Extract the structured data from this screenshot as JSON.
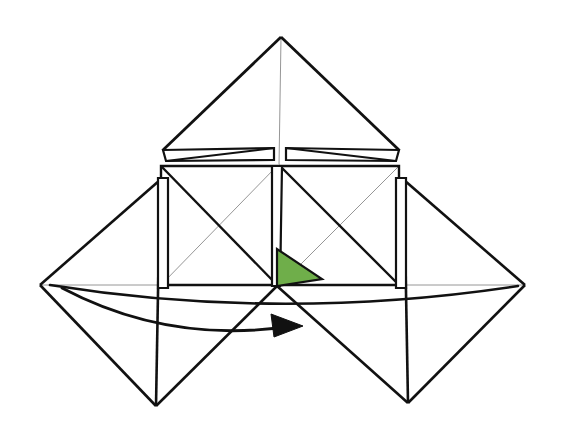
{
  "figure": {
    "background_color": "#ffffff",
    "stroke_color": "#111111",
    "thin_stroke_color": "#8a8a8a",
    "highlight_fill": "#6fae4a",
    "highlight_stroke": "#111111",
    "stroke_width_heavy": 3.0,
    "stroke_width_medium": 2.2,
    "stroke_width_thin": 0.9,
    "canvas": {
      "width": 564,
      "height": 421
    },
    "key_points": {
      "top_apex": [
        281,
        37
      ],
      "center_junction": [
        277,
        286
      ],
      "left_vertex": [
        40,
        285
      ],
      "right_vertex": [
        525,
        285
      ],
      "bottom_left_vertex": [
        156,
        406
      ],
      "bottom_right_vertex": [
        408,
        403
      ],
      "left_square_top_left": [
        161,
        166
      ],
      "right_square_top_right": [
        399,
        166
      ]
    },
    "highlight_triangle": {
      "name": "green-flap",
      "points": "277,249 277,286 322,279",
      "fill": "#6fae4a"
    },
    "arrow": {
      "name": "fold-direction-arrow",
      "path": "M 62,288 Q 170,345 292,326",
      "tip": [
        303,
        326
      ],
      "head_points": "303,326 271,314 274,337"
    },
    "paths": {
      "top_triangle_left": "M 281,37 L 163,150",
      "top_triangle_right": "M 281,37 L 399,150",
      "top_triangle_center_thin": "M 281,37 L 279,166",
      "top_flap_left_outer": "M 163,150 L 274,148 L 274,160 L 166,161 Z",
      "top_flap_right_outer": "M 399,150 L 286,148 L 286,160 L 396,161 Z",
      "top_flap_left_diag": "M 166,161 L 274,148",
      "top_flap_right_diag": "M 396,161 L 286,148",
      "left_square": "M 161,166 L 277,166 L 277,285 L 161,285 Z",
      "right_square": "M 280,166 L 399,166 L 399,285 L 280,285 Z",
      "left_square_diag_a": "M 161,166 L 277,285",
      "left_square_diag_b": "M 161,285 L 277,166",
      "right_square_diag_a": "M 280,166 L 399,285",
      "right_square_diag_b": "M 280,285 L 399,166",
      "left_wing_upper": "M 160,180 L 40,285",
      "left_wing_lower": "M 40,285 L 156,406",
      "left_wing_inner": "M 156,406 L 160,180",
      "right_wing_upper": "M 404,180 L 525,285",
      "right_wing_lower": "M 525,285 L 408,403",
      "right_wing_inner": "M 408,403 L 404,180",
      "left_flap_strip": "M 158,178 L 168,178 L 168,288 L 158,288 Z",
      "right_flap_strip": "M 396,178 L 406,178 L 406,288 L 396,288 Z",
      "center_strip": "M 272,166 L 282,166 L 280,286 L 272,286 Z",
      "baseline_thin": "M 40,285 L 525,285",
      "arc_upper": "M 50,285 Q 281,322 518,286",
      "arc_lower": "M 62,288 Q 281,346 470,290",
      "center_to_bottom_left": "M 277,286 L 156,406",
      "center_to_bottom_right": "M 277,286 L 408,403",
      "green_edge_top": "M 277,249 L 322,279",
      "green_edge_right": "M 322,279 L 277,286"
    }
  }
}
